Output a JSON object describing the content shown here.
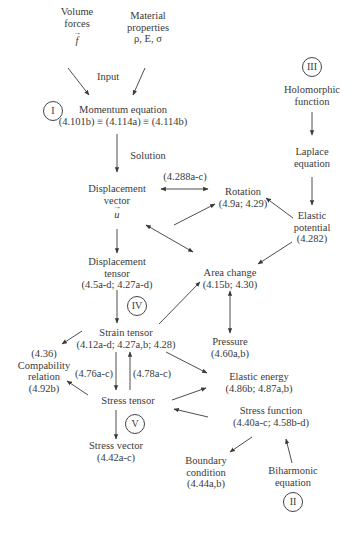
{
  "diagram": {
    "type": "flowchart",
    "nodes": {
      "volume_forces": {
        "lines": [
          "Volume",
          "forces"
        ],
        "symbol": "f"
      },
      "material_properties": {
        "lines": [
          "Material",
          "properties",
          "ρ, E, σ"
        ]
      },
      "input_label": "Input",
      "momentum_equation": {
        "lines": [
          "Momentum equation",
          "(4.101b) ≡ (4.114a) ≡ (4.114b)"
        ]
      },
      "solution_label": "Solution",
      "displacement_vector": {
        "lines": [
          "Displacement",
          "vector"
        ],
        "symbol": "u"
      },
      "rotation_link_label": "(4.288a-c)",
      "rotation": {
        "lines": [
          "Rotation",
          "(4.9a; 4.29)"
        ]
      },
      "holomorphic_function": {
        "lines": [
          "Holomorphic",
          "function"
        ]
      },
      "laplace_equation": {
        "lines": [
          "Laplace",
          "equation"
        ]
      },
      "elastic_potential": {
        "lines": [
          "Elastic",
          "potential",
          "(4.282)"
        ]
      },
      "displacement_tensor": {
        "lines": [
          "Displacement",
          "tensor",
          "(4.5a-d; 4.27a-d)"
        ]
      },
      "area_change": {
        "lines": [
          "Area change",
          "(4.15b; 4.30)"
        ]
      },
      "strain_tensor": {
        "lines": [
          "Strain tensor",
          "(4.12a-d; 4.27a,b; 4.28)"
        ]
      },
      "pressure": {
        "lines": [
          "Pressure",
          "(4.60a,b)"
        ]
      },
      "compatibility_relation": {
        "lines": [
          "(4.36)",
          "Compability",
          "relation",
          "(4.92b)"
        ]
      },
      "strain_to_stress_label": "(4.76a-c)",
      "stress_to_strain_label": "(4.78a-c)",
      "elastic_energy": {
        "lines": [
          "Elastic energy",
          "(4.86b; 4.87a,b)"
        ]
      },
      "stress_tensor": {
        "lines": [
          "Stress tensor"
        ]
      },
      "stress_function": {
        "lines": [
          "Stress function",
          "(4.40a-c; 4.58b-d)"
        ]
      },
      "stress_vector": {
        "lines": [
          "Stress vector",
          "(4.42a-c)"
        ]
      },
      "boundary_condition": {
        "lines": [
          "Boundary",
          "condition",
          "(4.44a,b)"
        ]
      },
      "biharmonic_equation": {
        "lines": [
          "Biharmonic",
          "equation"
        ]
      }
    },
    "circles": {
      "I": "I",
      "II": "II",
      "III": "III",
      "IV": "IV",
      "V": "V"
    }
  }
}
